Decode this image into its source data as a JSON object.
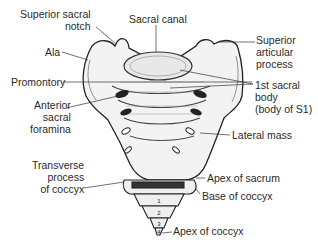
{
  "figure": {
    "labels": {
      "superior_sacral_notch": [
        "Superior sacral",
        "notch"
      ],
      "sacral_canal": "Sacral canal",
      "ala": "Ala",
      "superior_articular_process": [
        "Superior",
        "articular",
        "process"
      ],
      "promontory": "Promontory",
      "first_sacral_body": [
        "1st sacral",
        "body",
        "(body of S1)"
      ],
      "anterior_sacral_foramina": [
        "Anterior",
        "sacral",
        "foramina"
      ],
      "lateral_mass": "Lateral mass",
      "transverse_process_of_coccyx": [
        "Transverse",
        "process",
        "of coccyx"
      ],
      "apex_of_sacrum": "Apex of sacrum",
      "base_of_coccyx": "Base of coccyx",
      "apex_of_coccyx": "Apex of coccyx"
    },
    "coccyx_segment_numbers": [
      "1",
      "2",
      "3",
      "4"
    ]
  }
}
